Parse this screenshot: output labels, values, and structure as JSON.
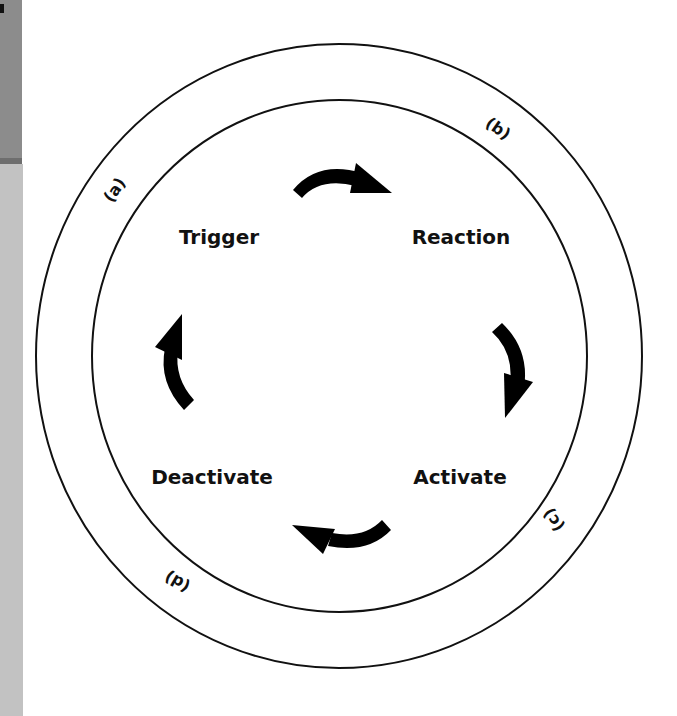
{
  "diagram": {
    "type": "cycle",
    "stages": [
      {
        "id": "trigger",
        "label": "Trigger"
      },
      {
        "id": "reaction",
        "label": "Reaction"
      },
      {
        "id": "activate",
        "label": "Activate"
      },
      {
        "id": "deactivate",
        "label": "Deactivate"
      }
    ],
    "ring_labels": [
      {
        "id": "a",
        "label": "(a)"
      },
      {
        "id": "b",
        "label": "(b)"
      },
      {
        "id": "c",
        "label": "(c)"
      },
      {
        "id": "d",
        "label": "(d)"
      }
    ],
    "flow": [
      "Trigger",
      "Reaction",
      "Activate",
      "Deactivate",
      "Trigger"
    ],
    "direction": "clockwise",
    "colors": {
      "line": "#111111",
      "arrow": "#000000",
      "background": "#ffffff",
      "side_strip_dark": "#8c8c8c",
      "side_strip_light": "#c2c2c2"
    }
  }
}
